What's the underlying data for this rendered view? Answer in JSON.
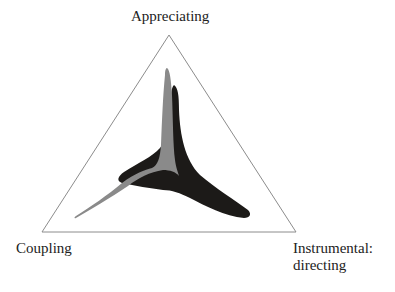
{
  "diagram": {
    "type": "ternary-triangle",
    "vertices": {
      "top": "Appreciating",
      "bottom_left": "Coupling",
      "bottom_right_line1": "Instrumental:",
      "bottom_right_line2": "directing"
    },
    "shapes": [
      {
        "name": "black-profile",
        "color": "#1c1a18",
        "description": "three-lobed star shape extending toward all three vertices"
      },
      {
        "name": "gray-profile",
        "color": "#8a8a8a",
        "description": "thin three-armed shape with long tails toward top and bottom-left vertices"
      }
    ],
    "colors": {
      "triangle_stroke": "#8c8c8c",
      "black_shape": "#1c1a18",
      "gray_shape": "#8a8a8a",
      "text": "#222222"
    }
  }
}
